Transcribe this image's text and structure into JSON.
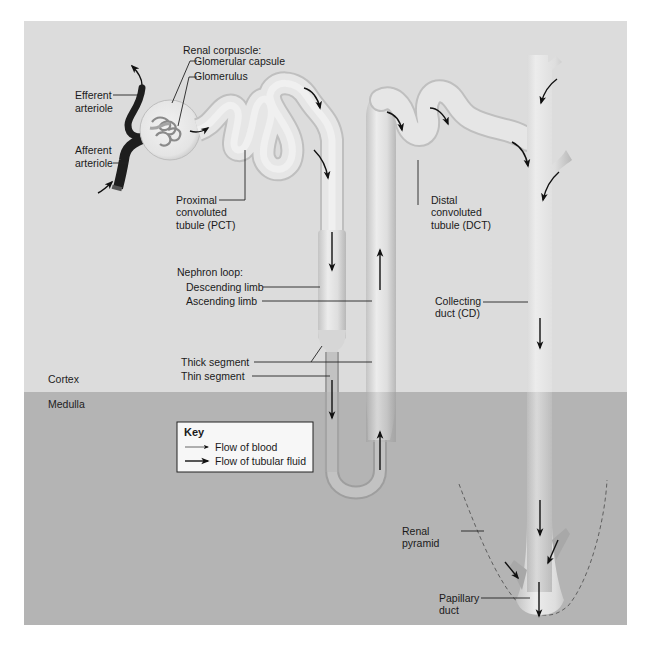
{
  "colors": {
    "cortex_bg": "#dcdcdc",
    "medulla_bg": "#b4b4b4",
    "tubule_fill": "#e6e6e6",
    "tubule_edge": "#bdbdbd",
    "arteriole": "#1e1e1e",
    "key_bg": "#f7f7f7",
    "arrow": "#111111"
  },
  "regions": {
    "cortex": "Cortex",
    "medulla": "Medulla"
  },
  "labels": {
    "renal_corpuscle": "Renal corpuscle:",
    "glomerular_capsule": "Glomerular capsule",
    "glomerulus": "Glomerulus",
    "efferent_1": "Efferent",
    "efferent_2": "arteriole",
    "afferent_1": "Afferent",
    "afferent_2": "arteriole",
    "pct_1": "Proximal",
    "pct_2": "convoluted",
    "pct_3": "tubule (PCT)",
    "dct_1": "Distal",
    "dct_2": "convoluted",
    "dct_3": "tubule (DCT)",
    "nephron_loop": "Nephron loop:",
    "descending_limb": "Descending limb",
    "ascending_limb": "Ascending limb",
    "thick_segment": "Thick segment",
    "thin_segment": "Thin segment",
    "cd_1": "Collecting",
    "cd_2": "duct (CD)",
    "pyramid_1": "Renal",
    "pyramid_2": "pyramid",
    "papillary_1": "Papillary",
    "papillary_2": "duct"
  },
  "key": {
    "title": "Key",
    "items": [
      {
        "label": "Flow of blood",
        "icon": "thin-arrow-icon"
      },
      {
        "label": "Flow of tubular fluid",
        "icon": "thick-arrow-icon"
      }
    ]
  }
}
